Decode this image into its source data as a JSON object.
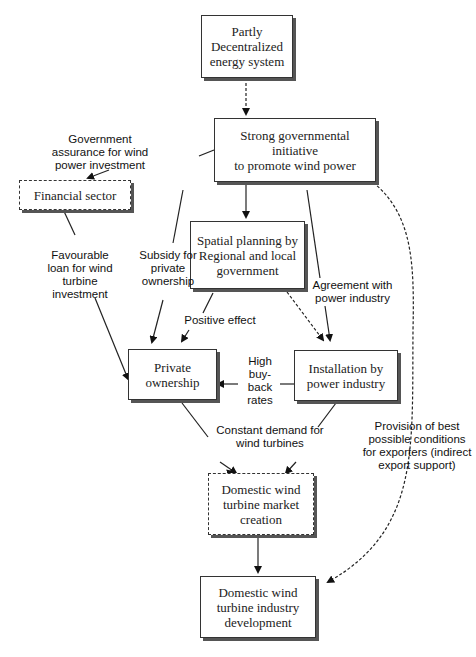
{
  "diagram": {
    "nodes": {
      "decentralized": {
        "text": "Partly\nDecentralized\nenergy system",
        "style": "solid"
      },
      "government": {
        "text": "Strong governmental initiative\nto promote wind power",
        "style": "solid"
      },
      "financial": {
        "text": "Financial sector",
        "style": "dashed"
      },
      "spatial": {
        "text": "Spatial planning by\nRegional and local\ngovernment",
        "style": "solid"
      },
      "private": {
        "text": "Private\nownership",
        "style": "solid"
      },
      "installation": {
        "text": "Installation by\npower industry",
        "style": "solid"
      },
      "market": {
        "text": "Domestic wind\nturbine market\ncreation",
        "style": "dashed"
      },
      "industry": {
        "text": "Domestic wind\nturbine industry\ndevelopment",
        "style": "solid"
      }
    },
    "edge_labels": {
      "assurance": "Government\nassurance for wind\npower investment",
      "loan": "Favourable\nloan for wind\nturbine\ninvestment",
      "subsidy": "Subsidy for\nprivate\nownership",
      "positive": "Positive effect",
      "agreement": "Agreement with\npower industry",
      "buyback": "High\nbuy-\nback\nrates",
      "demand": "Constant demand for\nwind turbines",
      "export": "Provision of best\npossible conditions\nfor exporters (indirect\nexport support)"
    },
    "edges": [
      {
        "from": "decentralized",
        "to": "government",
        "style": "dashed"
      },
      {
        "from": "government",
        "to": "financial",
        "style": "solid",
        "label": "assurance"
      },
      {
        "from": "government",
        "to": "spatial",
        "style": "solid"
      },
      {
        "from": "government",
        "to": "private",
        "style": "solid",
        "label": "subsidy"
      },
      {
        "from": "government",
        "to": "installation",
        "style": "solid",
        "label": "agreement"
      },
      {
        "from": "government",
        "to": "industry",
        "style": "dashed",
        "label": "export"
      },
      {
        "from": "financial",
        "to": "private",
        "style": "solid",
        "label": "loan"
      },
      {
        "from": "spatial",
        "to": "private",
        "style": "solid",
        "label": "positive"
      },
      {
        "from": "spatial",
        "to": "installation",
        "style": "dashed"
      },
      {
        "from": "installation",
        "to": "private",
        "style": "solid",
        "label": "buyback"
      },
      {
        "from": "private",
        "to": "market",
        "style": "solid",
        "label": "demand"
      },
      {
        "from": "installation",
        "to": "market",
        "style": "solid",
        "label": "demand"
      },
      {
        "from": "market",
        "to": "industry",
        "style": "solid"
      }
    ]
  }
}
